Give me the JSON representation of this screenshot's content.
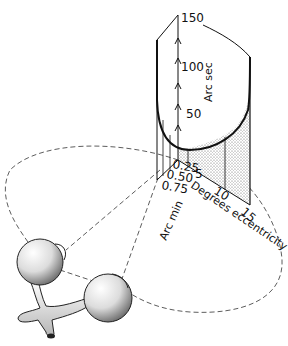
{
  "figure": {
    "vertical_axis": {
      "label": "Arc sec",
      "ticks": [
        "50",
        "100",
        "150"
      ]
    },
    "eccentricity_axis": {
      "label": "Degrees eccentricity",
      "ticks": [
        "5",
        "10",
        "15"
      ]
    },
    "depth_axis": {
      "label": "Arc min",
      "ticks": [
        "0.25",
        "0.50",
        "0.75"
      ]
    }
  }
}
